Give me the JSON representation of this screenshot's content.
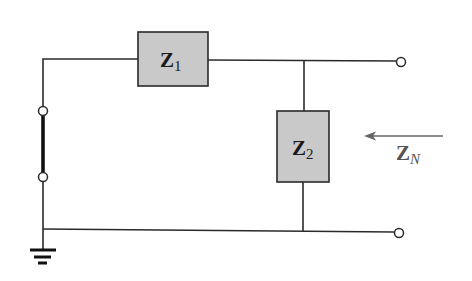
{
  "diagram": {
    "type": "circuit-schematic",
    "components": {
      "z1": {
        "symbol": "Z",
        "subscript": "1",
        "role": "series impedance"
      },
      "z2": {
        "symbol": "Z",
        "subscript": "2",
        "role": "shunt impedance"
      }
    },
    "annotation": {
      "symbol": "Z",
      "subscript": "N",
      "arrow_direction": "left"
    },
    "colors": {
      "wire": "#2a2a2a",
      "box_fill": "#c9c9c9",
      "annotation": "#555555",
      "background": "#ffffff"
    }
  }
}
